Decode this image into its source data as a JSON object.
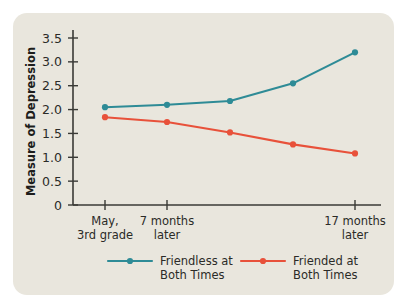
{
  "panel": {
    "background_color": "#e9e6dd"
  },
  "chart_data": {
    "type": "line",
    "title": "",
    "xlabel": "",
    "ylabel": "Measure of Depression",
    "x": [
      "May, 3rd grade",
      "7 months later",
      "",
      "",
      "17 months later"
    ],
    "categories": [
      "May, 3rd grade",
      "7 months later",
      "",
      "",
      "17 months later"
    ],
    "xtick_labels": [
      {
        "index": 0,
        "line1": "May,",
        "line2": "3rd grade"
      },
      {
        "index": 1,
        "line1": "7 months",
        "line2": "later"
      },
      {
        "index": 4,
        "line1": "17 months",
        "line2": "later"
      }
    ],
    "ylim": [
      0,
      3.6
    ],
    "ytick_values": [
      0,
      0.5,
      1.0,
      1.5,
      2.0,
      2.5,
      3.0,
      3.5
    ],
    "ytick_labels": [
      "0",
      "0.5",
      "1.0",
      "1.5",
      "2.0",
      "2.5",
      "3.0",
      "3.5"
    ],
    "grid": false,
    "legend_position": "bottom",
    "series": [
      {
        "name": "Friendless at Both Times",
        "legend_line1": "Friendless at",
        "legend_line2": "Both Times",
        "color": "#2e8b96",
        "values": [
          2.05,
          2.1,
          2.18,
          2.55,
          3.2
        ]
      },
      {
        "name": "Friended at Both Times",
        "legend_line1": "Friended at",
        "legend_line2": "Both Times",
        "color": "#e8513a",
        "values": [
          1.84,
          1.74,
          1.52,
          1.27,
          1.08
        ]
      }
    ]
  }
}
